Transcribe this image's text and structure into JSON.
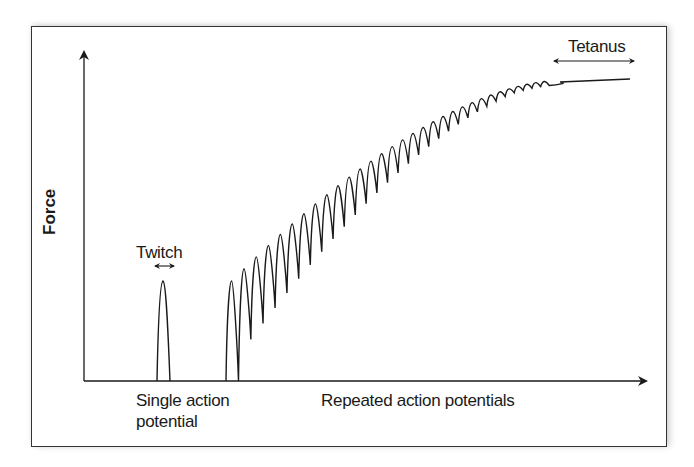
{
  "diagram": {
    "y_axis_label": "Force",
    "x_axis_labels": {
      "single": [
        "Single action",
        "potential"
      ],
      "repeated": "Repeated action potentials"
    },
    "annotations": {
      "twitch": "Twitch",
      "tetanus": "Tetanus"
    },
    "colors": {
      "line": "#1a1a1a",
      "frame": "#333333",
      "background": "#ffffff"
    }
  },
  "chart_data": {
    "type": "line",
    "title": "",
    "xlabel": "Single action potential / Repeated action potentials",
    "ylabel": "Force",
    "grid": false,
    "legend": null,
    "annotations": [
      "Twitch",
      "Tetanus"
    ],
    "series": [
      {
        "name": "Single twitch",
        "description": "one action potential produces a single brief force peak",
        "peak_relative": 0.3
      },
      {
        "name": "Summation train",
        "description": "repeated action potentials produce successive peaks that summate, rising with decreasing ripple",
        "peak_count_approx": 30,
        "first_peak_relative": 0.3,
        "final_relative": 0.91
      },
      {
        "name": "Tetanus",
        "description": "fused smooth plateau of sustained maximal force",
        "level_relative": 0.92
      }
    ]
  }
}
